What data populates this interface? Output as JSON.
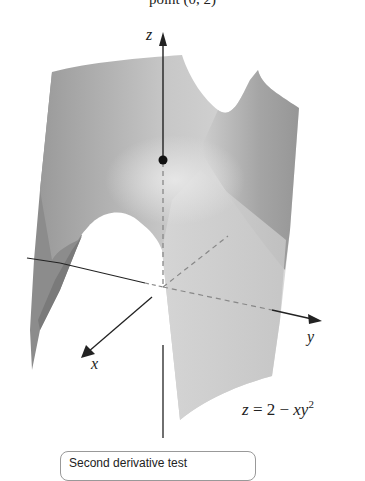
{
  "figure": {
    "top_caption": "point (0, 2)",
    "axes": {
      "z_label": "z",
      "x_label": "x",
      "y_label": "y"
    },
    "surface_equation": {
      "prefix": "z = 2 − ",
      "var_x": "x",
      "var_y": "y",
      "exponent": "2"
    },
    "marked_point": "(0, 0, 2)",
    "bottom_box_text": "Second derivative test"
  },
  "colors": {
    "surface_light": "#d9d9d9",
    "surface_mid": "#b3b3b3",
    "surface_dark": "#7f7f7f",
    "axis": "#222222",
    "dashed_axis": "#888888"
  }
}
